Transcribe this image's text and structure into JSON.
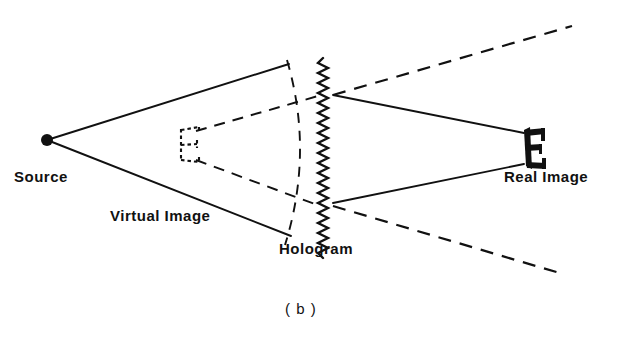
{
  "figure": {
    "caption": "( b )",
    "background_color": "#ffffff",
    "ink_color": "#111111",
    "labels": {
      "source": "Source",
      "virtual_image": "Virtual Image",
      "hologram": "Hologram",
      "real_image": "Real Image"
    },
    "elements": {
      "source_point": {
        "name": "source-point",
        "x": 47,
        "y": 140,
        "radius": 6
      },
      "hologram_plate": {
        "name": "hologram-plate",
        "x": 323,
        "y_top": 58,
        "y_bottom": 258,
        "style": "vertical-zigzag",
        "amplitude": 5,
        "period": 10
      },
      "wavefront_arc": {
        "name": "wavefront-arc",
        "style": "dashed-curve",
        "start": [
          287,
          60
        ],
        "control": [
          312,
          152
        ],
        "end": [
          285,
          245
        ]
      },
      "virtual_image_glyph": {
        "name": "virtual-image-e-glyph",
        "letter": "E",
        "style": "dashed-outline",
        "x": 178,
        "y": 128,
        "width": 22,
        "height": 32
      },
      "real_image_glyph": {
        "name": "real-image-e-glyph",
        "letter": "E",
        "style": "solid-filled",
        "x": 521,
        "y": 128,
        "width": 22,
        "height": 38
      }
    },
    "rays": {
      "solid_incident": [
        {
          "name": "ray-source-upper",
          "from": [
            47,
            140
          ],
          "to": [
            289,
            64
          ]
        },
        {
          "name": "ray-source-lower",
          "from": [
            47,
            140
          ],
          "to": [
            291,
            236
          ]
        }
      ],
      "solid_converging": [
        {
          "name": "ray-real-upper",
          "from": [
            333,
            95
          ],
          "to": [
            523,
            134
          ]
        },
        {
          "name": "ray-real-lower",
          "from": [
            333,
            202
          ],
          "to": [
            523,
            163
          ]
        }
      ],
      "dashed_diverging": [
        {
          "name": "ray-virtual-upper",
          "from": [
            333,
            95
          ],
          "to": [
            569,
            27
          ]
        },
        {
          "name": "ray-virtual-lower",
          "from": [
            333,
            205
          ],
          "to": [
            561,
            273
          ]
        }
      ],
      "dashed_virtual_cone": [
        {
          "name": "virtual-cone-upper",
          "from": [
            196,
            131
          ],
          "to": [
            300,
            102
          ]
        },
        {
          "name": "virtual-cone-lower",
          "from": [
            196,
            160
          ],
          "to": [
            303,
            200
          ]
        },
        {
          "name": "virtual-cone-back-upper",
          "from": [
            300,
            102
          ],
          "to": [
            318,
            96
          ]
        },
        {
          "name": "virtual-cone-back-lower",
          "from": [
            303,
            200
          ],
          "to": [
            320,
            205
          ]
        }
      ]
    }
  }
}
